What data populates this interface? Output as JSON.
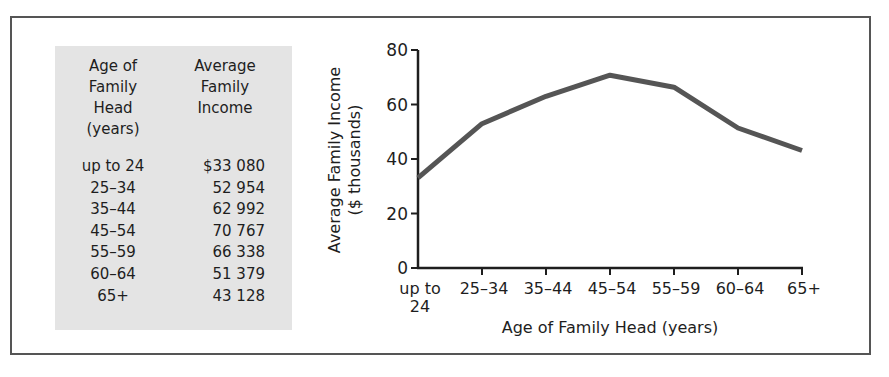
{
  "table": {
    "headers": [
      [
        "Age of",
        "Family",
        "Head",
        "(years)"
      ],
      [
        "Average",
        "Family",
        "Income"
      ]
    ],
    "rows": [
      {
        "age": "up to 24",
        "income": "$33 080"
      },
      {
        "age": "25–34",
        "income": "52 954"
      },
      {
        "age": "35–44",
        "income": "62 992"
      },
      {
        "age": "45–54",
        "income": "70 767"
      },
      {
        "age": "55–59",
        "income": "66 338"
      },
      {
        "age": "60–64",
        "income": "51 379"
      },
      {
        "age": "65+",
        "income": "43 128"
      }
    ]
  },
  "chart_data": {
    "type": "line",
    "title": "",
    "xlabel": "Age of Family Head (years)",
    "ylabel": "Average Family Income ($ thousands)",
    "ylabel_lines": [
      "Average Family Income",
      "($ thousands)"
    ],
    "categories": [
      "up to 24",
      "25–34",
      "35–44",
      "45–54",
      "55–59",
      "60–64",
      "65+"
    ],
    "category_lines": [
      [
        "up to",
        "24"
      ],
      [
        "25–34"
      ],
      [
        "35–44"
      ],
      [
        "45–54"
      ],
      [
        "55–59"
      ],
      [
        "60–64"
      ],
      [
        "65+"
      ]
    ],
    "series": [
      {
        "name": "Average Family Income",
        "values": [
          33.08,
          52.954,
          62.992,
          70.767,
          66.338,
          51.379,
          43.128
        ],
        "color": "#555555"
      }
    ],
    "yticks": [
      0,
      20,
      40,
      60,
      80
    ],
    "ylim": [
      0,
      80
    ],
    "grid": false,
    "legend": "none"
  },
  "colors": {
    "frame": "#555555",
    "table_bg": "#e4e4e4",
    "line": "#555555",
    "axis": "#1e1e1e"
  }
}
